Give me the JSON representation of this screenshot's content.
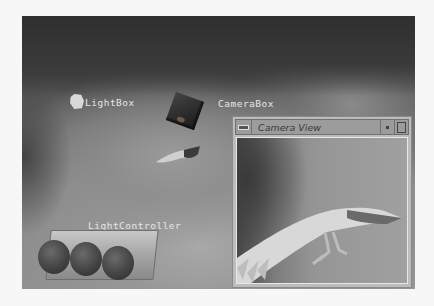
{
  "scene": {
    "objects": [
      {
        "id": "lightbox",
        "label": "LightBox"
      },
      {
        "id": "camerabox",
        "label": "CameraBox"
      },
      {
        "id": "lightcontroller",
        "label": "LightController"
      }
    ]
  },
  "camera_window": {
    "title": "Camera View",
    "buttons": {
      "system_menu_icon": "system-menu-icon",
      "minimize_icon": "minimize-icon",
      "maximize_icon": "maximize-icon"
    }
  }
}
